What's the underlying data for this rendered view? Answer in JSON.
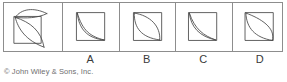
{
  "figure": {
    "kind": "multiple-choice-spatial-reasoning",
    "stroke_color": "#4a4a4a",
    "frame_color": "#8d8d8d",
    "background": "#ffffff",
    "prompt": {
      "name": "prompt-figure",
      "description": "Square with leaf/lens shape whose upper lobe extends above and right of the square"
    },
    "options": [
      {
        "letter": "A",
        "description": "Square with two curves both bowing toward the lower-left corner (crescent from top-left to bottom-right)"
      },
      {
        "letter": "B",
        "description": "Square with a wide symmetric lens (leaf) along the top-left to bottom-right diagonal"
      },
      {
        "letter": "C",
        "description": "Square with a narrow crescent of two nearly parallel curves bowing toward the lower-left"
      },
      {
        "letter": "D",
        "description": "Square with a narrow lens along the diagonal whose right curve bulges past the square edge"
      }
    ]
  },
  "labels": {
    "a": "A",
    "b": "B",
    "c": "C",
    "d": "D"
  },
  "copyright": {
    "text": "© John Wiley & Sons, Inc."
  }
}
